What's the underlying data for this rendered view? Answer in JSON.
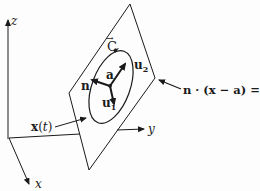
{
  "figure": {
    "axes": {
      "z_label": "z",
      "y_label": "y",
      "x_label": "x"
    },
    "curve_label": "C",
    "curve_arrow": "→",
    "vectors": {
      "n": "n",
      "a": "a",
      "u1": "u",
      "u1_sub": "1",
      "u2": "u",
      "u2_sub": "2"
    },
    "path_label": {
      "bold": "x",
      "paren_open": "(",
      "var": "t",
      "paren_close": ")"
    },
    "plane_equation": "n · (x − a) = 0",
    "colors": {
      "ink": "#1a1a1a",
      "background": "#fdfdfd"
    }
  }
}
